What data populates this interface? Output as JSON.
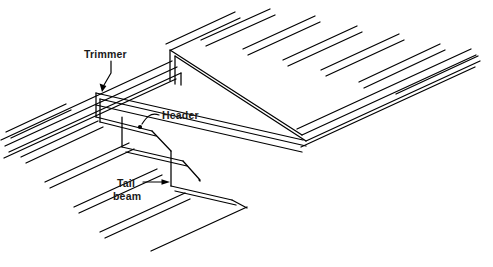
{
  "figure": {
    "background_color": "#ffffff",
    "line_color": "#000000",
    "text_color": "#1a1a1a"
  },
  "labels": {
    "trimmer": {
      "text": "Trimmer",
      "text_x": 84,
      "text_y": 58,
      "leader": "M 110 61 L 110 72 L 104 84",
      "arrow_x": 102,
      "arrow_y": 89
    },
    "header": {
      "text": "Header",
      "text_x": 162,
      "text_y": 119,
      "leader": "M 160 116 C 150 113 146 118 142 124",
      "arrow_x": 139,
      "arrow_y": 128
    },
    "tail_beam": {
      "line1": "Tail",
      "line2": "beam",
      "line1_x": 117,
      "line1_y": 186,
      "line2_x": 114,
      "line2_y": 199,
      "leader": "M 145 182 L 164 182",
      "arrow_x": 169,
      "arrow_y": 182
    }
  },
  "geometry": {
    "joists_upper": [
      "M 166 44 L 235 12",
      "M 170 49 L 240 17",
      "M 199 39 L 268 8",
      "M 203 44 L 272 12",
      "M 241 48 L 313 15",
      "M 245 53 L 317 20",
      "M 281 59 L 355 25",
      "M 285 64 L 359 30",
      "M 318 69 L 396 33",
      "M 322 74 L 400 38",
      "M 356 81 L 437 43",
      "M 360 86 L 441 48",
      "M 392 92 L 472 55"
    ],
    "joists_lower": [
      "M 8 133 L 66 106",
      "M 12 138 L 70 111",
      "M 22 157 L 99 122",
      "M 26 162 L 103 127",
      "M 46 182 L 130 143",
      "M 50 187 L 134 148",
      "M 75 207 L 158 169",
      "M 79 212 L 162 174",
      "M 101 232 L 186 193",
      "M 105 237 L 190 198",
      "M 152 250 L 246 207"
    ],
    "trimmer_left": {
      "top_outer": "M 2 139 L 172 61",
      "top_inner": "M 5 145 L 176 66",
      "front_edge": "M 7 150 L 178 71",
      "bottom_outer": "M 2 152 L 172 74"
    },
    "trimmer_right": {
      "top_outer": "M 296 128 L 470 48",
      "top_inner": "M 300 133 L 474 53",
      "front_edge": "M 302 138 L 476 58",
      "bottom_outer": "M 297 141 L 470 61"
    },
    "header_main": {
      "top": "M 97 93 L 302 138",
      "inner": "M 100 99 L 299 143",
      "bottom_left": "M 97 104 L 302 149"
    },
    "header_upper": {
      "top": "M 170 49 L 300 133",
      "face": "M 173 55 L 297 138"
    },
    "verticals": [
      "M 97 93 L 97 116",
      "M 170 49 L 170 80",
      "M 121 117 L 121 146",
      "M 155 148 L 155 176",
      "M 178 71 L 178 83"
    ],
    "tail_step_1": {
      "top": "M 97 116 L 143 127",
      "edge": "M 121 117 L 121 146",
      "lower": "M 99 121 L 145 132"
    },
    "tail_step_2": {
      "top": "M 121 146 L 178 160",
      "lower": "M 123 151 L 180 165"
    },
    "tail_step_3": {
      "top": "M 155 176 L 228 194",
      "lower": "M 157 181 L 230 199"
    },
    "inner_panel": [
      "M 178 83 L 246 207",
      "M 180 80 L 250 205"
    ]
  }
}
